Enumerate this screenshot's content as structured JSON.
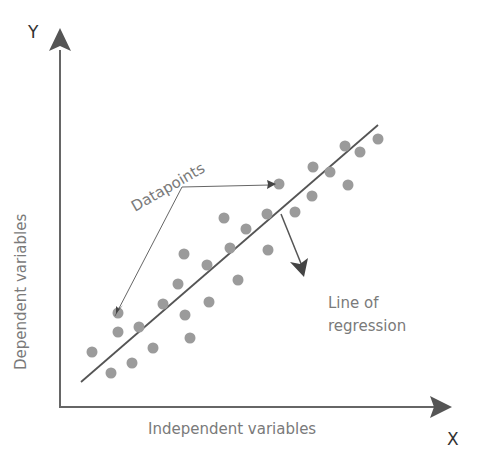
{
  "diagram": {
    "axes": {
      "y_letter": "Y",
      "x_letter": "X",
      "y_label": "Dependent variables",
      "x_label": "Independent variables"
    },
    "annotations": {
      "datapoints": "Datapoints",
      "line_of_regression_line1": "Line of",
      "line_of_regression_line2": "regression"
    },
    "colors": {
      "axis": "#555555",
      "points": "#999999",
      "text": "#7a7a7a"
    }
  },
  "chart_data": {
    "type": "scatter",
    "title": "",
    "xlabel": "Independent variables",
    "ylabel": "Dependent variables",
    "grid": false,
    "points_px": [
      [
        92,
        352
      ],
      [
        118,
        313
      ],
      [
        118,
        332
      ],
      [
        111,
        373
      ],
      [
        139,
        327
      ],
      [
        132,
        363
      ],
      [
        153,
        348
      ],
      [
        163,
        304
      ],
      [
        178,
        284
      ],
      [
        185,
        315
      ],
      [
        190,
        338
      ],
      [
        184,
        254
      ],
      [
        209,
        302
      ],
      [
        207,
        265
      ],
      [
        224,
        218
      ],
      [
        230,
        248
      ],
      [
        246,
        229
      ],
      [
        238,
        280
      ],
      [
        267,
        214
      ],
      [
        268,
        250
      ],
      [
        279,
        184
      ],
      [
        295,
        212
      ],
      [
        313,
        167
      ],
      [
        312,
        196
      ],
      [
        330,
        172
      ],
      [
        345,
        146
      ],
      [
        348,
        185
      ],
      [
        360,
        152
      ],
      [
        378,
        139
      ]
    ],
    "regression_line_px": [
      [
        81,
        382
      ],
      [
        378,
        125
      ]
    ]
  }
}
